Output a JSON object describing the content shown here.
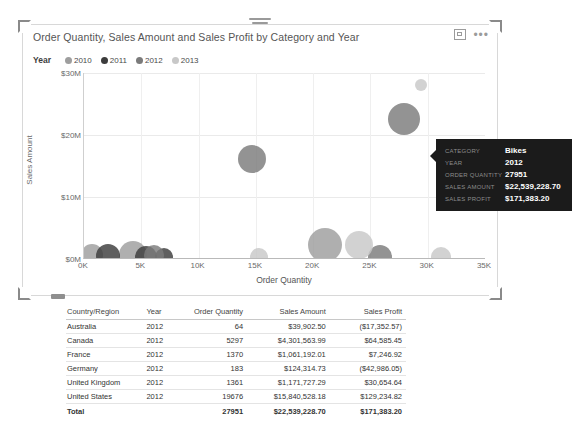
{
  "visual": {
    "title": "Order Quantity, Sales Amount and Sales Profit by Category and Year",
    "focus_icon": "focus-mode-icon",
    "more_icon": "•••"
  },
  "legend": {
    "title": "Year",
    "items": [
      {
        "label": "2010",
        "color": "#9e9e9e"
      },
      {
        "label": "2011",
        "color": "#3c3c3c"
      },
      {
        "label": "2012",
        "color": "#7b7b7b"
      },
      {
        "label": "2013",
        "color": "#c8c8c8"
      }
    ]
  },
  "tooltip": {
    "rows": [
      {
        "key": "CATEGORY",
        "value": "Bikes"
      },
      {
        "key": "YEAR",
        "value": "2012"
      },
      {
        "key": "ORDER QUANTITY",
        "value": "27951"
      },
      {
        "key": "SALES AMOUNT",
        "value": "$22,539,228.70"
      },
      {
        "key": "SALES PROFIT",
        "value": "$171,383.20"
      }
    ]
  },
  "chart_data": {
    "type": "scatter",
    "title": "Order Quantity, Sales Amount and Sales Profit by Category and Year",
    "xlabel": "Order Quantity",
    "ylabel": "Sales Amount",
    "xlim": [
      0,
      35000
    ],
    "ylim": [
      0,
      30000000
    ],
    "xticks": [
      "0K",
      "5K",
      "10K",
      "15K",
      "20K",
      "25K",
      "30K",
      "35K"
    ],
    "xtickvalues": [
      0,
      5000,
      10000,
      15000,
      20000,
      25000,
      30000,
      35000
    ],
    "yticks": [
      "$0M",
      "$10M",
      "$20M",
      "$30M"
    ],
    "ytickvalues": [
      0,
      10000000,
      20000000,
      30000000
    ],
    "grid": true,
    "legend_position": "top-left",
    "legend_title": "Year",
    "series": [
      {
        "name": "2010",
        "color": "#9e9e9e",
        "points": [
          {
            "x": 700,
            "y": 600000,
            "r": 11
          },
          {
            "x": 4300,
            "y": 700000,
            "r": 14
          },
          {
            "x": 21000,
            "y": 2300000,
            "r": 17
          }
        ]
      },
      {
        "name": "2011",
        "color": "#3c3c3c",
        "points": [
          {
            "x": 2100,
            "y": 500000,
            "r": 12
          },
          {
            "x": 5400,
            "y": 400000,
            "r": 11
          },
          {
            "x": 7000,
            "y": 300000,
            "r": 9
          }
        ]
      },
      {
        "name": "2012",
        "color": "#7b7b7b",
        "points": [
          {
            "x": 14700,
            "y": 16200000,
            "r": 14
          },
          {
            "x": 27951,
            "y": 22539228,
            "r": 16
          },
          {
            "x": 6100,
            "y": 600000,
            "r": 10
          },
          {
            "x": 25800,
            "y": 300000,
            "r": 12
          }
        ]
      },
      {
        "name": "2013",
        "color": "#c8c8c8",
        "points": [
          {
            "x": 29400,
            "y": 28100000,
            "r": 6
          },
          {
            "x": 24000,
            "y": 2200000,
            "r": 14
          },
          {
            "x": 15300,
            "y": 400000,
            "r": 9
          },
          {
            "x": 31200,
            "y": 400000,
            "r": 10
          }
        ]
      }
    ]
  },
  "table": {
    "columns": [
      "Country/Region",
      "Year",
      "Order Quantity",
      "Sales Amount",
      "Sales Profit"
    ],
    "rows": [
      [
        "Australia",
        "2012",
        "64",
        "$39,902.50",
        "($17,352.57)"
      ],
      [
        "Canada",
        "2012",
        "5297",
        "$4,301,563.99",
        "$64,585.45"
      ],
      [
        "France",
        "2012",
        "1370",
        "$1,061,192.01",
        "$7,246.92"
      ],
      [
        "Germany",
        "2012",
        "183",
        "$124,314.73",
        "($42,986.05)"
      ],
      [
        "United Kingdom",
        "2012",
        "1361",
        "$1,171,727.29",
        "$30,654.64"
      ],
      [
        "United States",
        "2012",
        "19676",
        "$15,840,528.18",
        "$129,234.82"
      ]
    ],
    "total": [
      "Total",
      "",
      "27951",
      "$22,539,228.70",
      "$171,383.20"
    ]
  }
}
